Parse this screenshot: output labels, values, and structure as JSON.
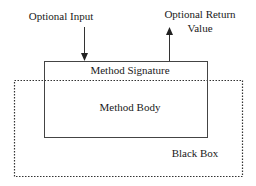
{
  "diagram": {
    "type": "black-box-method-diagram",
    "labels": {
      "optional_input": "Optional Input",
      "optional_return_line1": "Optional Return",
      "optional_return_line2": "Value",
      "method_signature": "Method Signature",
      "method_body": "Method Body",
      "black_box": "Black Box"
    },
    "nodes": [
      {
        "id": "method",
        "label": "Method Signature / Method Body",
        "style": "solid"
      },
      {
        "id": "black_box",
        "label": "Black Box",
        "style": "dotted"
      }
    ],
    "edges": [
      {
        "from": "Optional Input",
        "to": "method",
        "direction": "down"
      },
      {
        "from": "method",
        "to": "Optional Return Value",
        "direction": "up"
      }
    ],
    "colors": {
      "line": "#333333",
      "text": "#1a1a1a",
      "background": "#ffffff"
    }
  }
}
